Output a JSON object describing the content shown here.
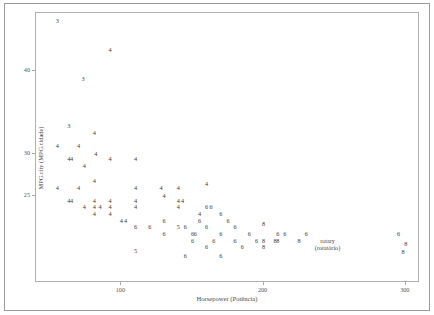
{
  "chart_data": {
    "type": "scatter",
    "title": "",
    "xlabel": "Horsepower (Potência)",
    "ylabel": "MPG.city (MPG.cidade)",
    "xlim": [
      40,
      310
    ],
    "ylim": [
      14.5,
      47
    ],
    "xticks": [
      100,
      200,
      300
    ],
    "yticks": [
      25,
      30,
      40
    ],
    "grid": false,
    "legend": "none",
    "point_label_meaning": "number-of-cylinders",
    "annotations": [
      {
        "text": "rotary\n(rotatório)",
        "x": 245,
        "y": 19.2
      }
    ],
    "points": [
      {
        "x": 55,
        "y": 46.0,
        "label": "3"
      },
      {
        "x": 92,
        "y": 42.5,
        "label": "4"
      },
      {
        "x": 73,
        "y": 39.0,
        "label": "3"
      },
      {
        "x": 63,
        "y": 33.4,
        "label": "3"
      },
      {
        "x": 81,
        "y": 32.6,
        "label": "4"
      },
      {
        "x": 55,
        "y": 31.0,
        "label": "4"
      },
      {
        "x": 70,
        "y": 31.0,
        "label": "4"
      },
      {
        "x": 82,
        "y": 30.0,
        "label": "4"
      },
      {
        "x": 63,
        "y": 29.4,
        "label": "4"
      },
      {
        "x": 65,
        "y": 29.4,
        "label": "4"
      },
      {
        "x": 92,
        "y": 29.4,
        "label": "4"
      },
      {
        "x": 74,
        "y": 28.6,
        "label": "4"
      },
      {
        "x": 110,
        "y": 29.4,
        "label": "4"
      },
      {
        "x": 81,
        "y": 26.8,
        "label": "4"
      },
      {
        "x": 55,
        "y": 25.9,
        "label": "4"
      },
      {
        "x": 70,
        "y": 25.9,
        "label": "4"
      },
      {
        "x": 110,
        "y": 25.9,
        "label": "4"
      },
      {
        "x": 128,
        "y": 25.9,
        "label": "4"
      },
      {
        "x": 140,
        "y": 25.9,
        "label": "4"
      },
      {
        "x": 160,
        "y": 26.4,
        "label": "4"
      },
      {
        "x": 130,
        "y": 25.0,
        "label": "4"
      },
      {
        "x": 63,
        "y": 24.4,
        "label": "4"
      },
      {
        "x": 65,
        "y": 24.4,
        "label": "4"
      },
      {
        "x": 81,
        "y": 24.4,
        "label": "4"
      },
      {
        "x": 92,
        "y": 24.4,
        "label": "4"
      },
      {
        "x": 110,
        "y": 24.4,
        "label": "4"
      },
      {
        "x": 140,
        "y": 24.4,
        "label": "4"
      },
      {
        "x": 143,
        "y": 24.4,
        "label": "4"
      },
      {
        "x": 74,
        "y": 23.6,
        "label": "4"
      },
      {
        "x": 81,
        "y": 23.6,
        "label": "4"
      },
      {
        "x": 85,
        "y": 23.6,
        "label": "4"
      },
      {
        "x": 92,
        "y": 23.6,
        "label": "4"
      },
      {
        "x": 110,
        "y": 23.6,
        "label": "4"
      },
      {
        "x": 140,
        "y": 23.6,
        "label": "4"
      },
      {
        "x": 160,
        "y": 23.6,
        "label": "6"
      },
      {
        "x": 163,
        "y": 23.6,
        "label": "6"
      },
      {
        "x": 81,
        "y": 22.8,
        "label": "4"
      },
      {
        "x": 92,
        "y": 22.8,
        "label": "4"
      },
      {
        "x": 155,
        "y": 22.8,
        "label": "4"
      },
      {
        "x": 170,
        "y": 22.8,
        "label": "6"
      },
      {
        "x": 100,
        "y": 22.0,
        "label": "4"
      },
      {
        "x": 103,
        "y": 22.0,
        "label": "4"
      },
      {
        "x": 130,
        "y": 22.0,
        "label": "6"
      },
      {
        "x": 155,
        "y": 22.0,
        "label": "6"
      },
      {
        "x": 175,
        "y": 22.0,
        "label": "6"
      },
      {
        "x": 140,
        "y": 21.2,
        "label": "5"
      },
      {
        "x": 145,
        "y": 21.2,
        "label": "6"
      },
      {
        "x": 110,
        "y": 21.2,
        "label": "6"
      },
      {
        "x": 120,
        "y": 21.2,
        "label": "6"
      },
      {
        "x": 160,
        "y": 21.2,
        "label": "6"
      },
      {
        "x": 180,
        "y": 21.2,
        "label": "6"
      },
      {
        "x": 200,
        "y": 21.6,
        "label": "8"
      },
      {
        "x": 130,
        "y": 20.4,
        "label": "6"
      },
      {
        "x": 150,
        "y": 20.4,
        "label": "6"
      },
      {
        "x": 152,
        "y": 20.4,
        "label": "6"
      },
      {
        "x": 170,
        "y": 20.4,
        "label": "6"
      },
      {
        "x": 190,
        "y": 20.4,
        "label": "6"
      },
      {
        "x": 210,
        "y": 20.4,
        "label": "6"
      },
      {
        "x": 215,
        "y": 20.4,
        "label": "6"
      },
      {
        "x": 230,
        "y": 20.4,
        "label": "6"
      },
      {
        "x": 150,
        "y": 19.6,
        "label": "6"
      },
      {
        "x": 165,
        "y": 19.6,
        "label": "6"
      },
      {
        "x": 180,
        "y": 19.6,
        "label": "6"
      },
      {
        "x": 195,
        "y": 19.6,
        "label": "6"
      },
      {
        "x": 200,
        "y": 19.6,
        "label": "8"
      },
      {
        "x": 208,
        "y": 19.6,
        "label": "8"
      },
      {
        "x": 210,
        "y": 19.6,
        "label": "8"
      },
      {
        "x": 225,
        "y": 19.6,
        "label": "8"
      },
      {
        "x": 110,
        "y": 18.4,
        "label": "5"
      },
      {
        "x": 160,
        "y": 18.8,
        "label": "6"
      },
      {
        "x": 185,
        "y": 18.8,
        "label": "6"
      },
      {
        "x": 200,
        "y": 18.8,
        "label": "8"
      },
      {
        "x": 145,
        "y": 17.8,
        "label": "6"
      },
      {
        "x": 170,
        "y": 17.8,
        "label": "6"
      },
      {
        "x": 295,
        "y": 20.4,
        "label": "6"
      },
      {
        "x": 300,
        "y": 19.2,
        "label": "8"
      },
      {
        "x": 298,
        "y": 18.2,
        "label": "8"
      }
    ]
  }
}
